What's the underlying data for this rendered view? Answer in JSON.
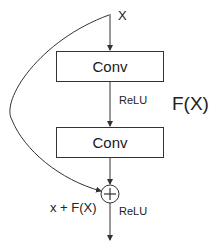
{
  "diagram": {
    "input_label": "X",
    "layers": [
      {
        "label": "Conv"
      },
      {
        "label": "Conv"
      }
    ],
    "activation_mid": "ReLU",
    "activation_out": "ReLU",
    "residual_function_label": "F(X)",
    "sum_label": "x + F(X)",
    "add_symbol": "+",
    "colors": {
      "stroke": "#333333",
      "text": "#222222",
      "background": "#ffffff"
    }
  }
}
